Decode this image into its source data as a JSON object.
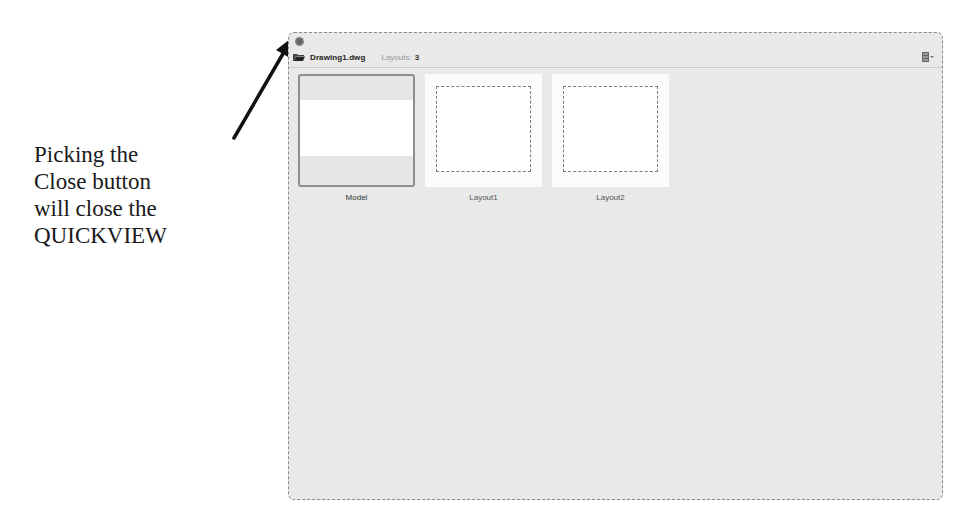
{
  "annotation": {
    "lines": [
      "Picking the",
      "Close button",
      "will close the",
      "QUICKVIEW"
    ]
  },
  "quickview": {
    "close_button_icon": "close-icon",
    "header": {
      "folder_icon": "folder-icon",
      "filename": "Drawing1.dwg",
      "layouts_label": "Layouts:",
      "layouts_count": "3",
      "view_options_icon": "view-options-icon"
    },
    "thumbnails": [
      {
        "label": "Model",
        "type": "model",
        "selected": true
      },
      {
        "label": "Layout1",
        "type": "layout",
        "selected": false
      },
      {
        "label": "Layout2",
        "type": "layout",
        "selected": false
      }
    ],
    "colors": {
      "panel_background": "#e9e9e9",
      "selected_border": "#8e8e8e",
      "text": "#222222"
    }
  }
}
